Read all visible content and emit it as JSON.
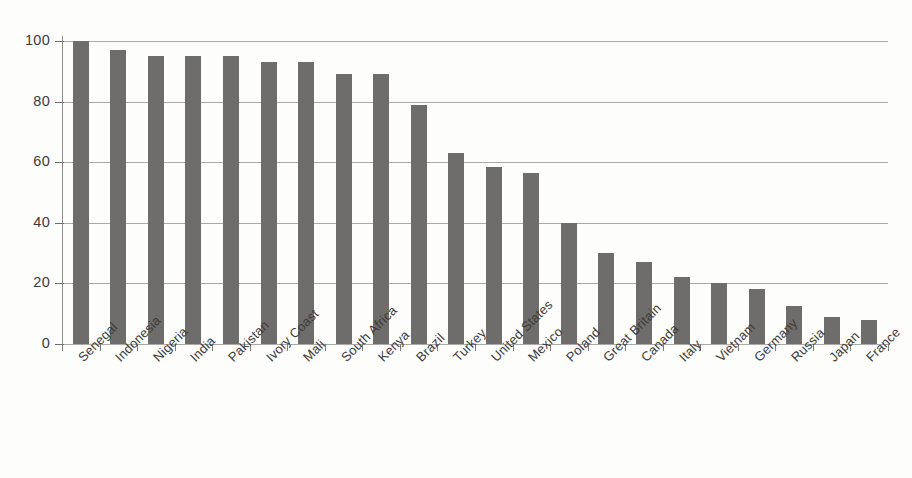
{
  "chart_data": {
    "type": "bar",
    "title": "",
    "xlabel": "",
    "ylabel": "",
    "ylim": [
      0,
      100
    ],
    "yticks": [
      0,
      20,
      40,
      60,
      80,
      100
    ],
    "grid": true,
    "legend": false,
    "orientation": "vertical",
    "bar_color": "#6e6d6b",
    "categories": [
      "Senegal",
      "Indonesia",
      "Nigeria",
      "India",
      "Pakistan",
      "Ivory Coast",
      "Mali",
      "South Africa",
      "Kenya",
      "Brazil",
      "Turkey",
      "United States",
      "Mexico",
      "Poland",
      "Great Britain",
      "Canada",
      "Italy",
      "Vietnam",
      "Germany",
      "Russia",
      "Japan",
      "France"
    ],
    "values": [
      100,
      97,
      95,
      95,
      95,
      93,
      93,
      89,
      89,
      79,
      63,
      58.5,
      56.5,
      40,
      30,
      27,
      22,
      20,
      18,
      12.5,
      9,
      8
    ]
  },
  "axis": {
    "y_tick_labels": [
      "100",
      "80",
      "60",
      "40",
      "20",
      "0"
    ]
  }
}
